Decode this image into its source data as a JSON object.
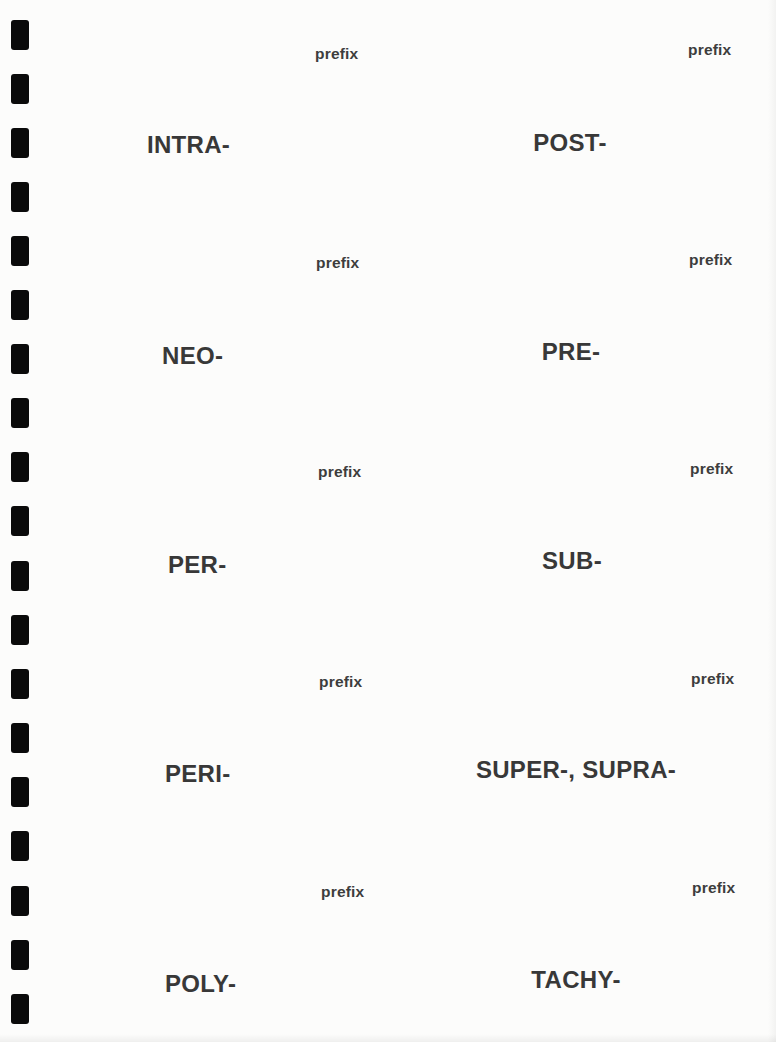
{
  "sheet": {
    "binding_holes": 19,
    "cards": [
      {
        "column": "left",
        "label": "prefix",
        "term": "INTRA-"
      },
      {
        "column": "right",
        "label": "prefix",
        "term": "POST-"
      },
      {
        "column": "left",
        "label": "prefix",
        "term": "NEO-"
      },
      {
        "column": "right",
        "label": "prefix",
        "term": "PRE-"
      },
      {
        "column": "left",
        "label": "prefix",
        "term": "PER-"
      },
      {
        "column": "right",
        "label": "prefix",
        "term": "SUB-"
      },
      {
        "column": "left",
        "label": "prefix",
        "term": "PERI-"
      },
      {
        "column": "right",
        "label": "prefix",
        "term": "SUPER-, SUPRA-"
      },
      {
        "column": "left",
        "label": "prefix",
        "term": "POLY-"
      },
      {
        "column": "right",
        "label": "prefix",
        "term": "TACHY-"
      }
    ]
  },
  "colors": {
    "paper": "#fcfcfb",
    "text": "#3b3b3b",
    "holes": "#0a0a0a"
  }
}
